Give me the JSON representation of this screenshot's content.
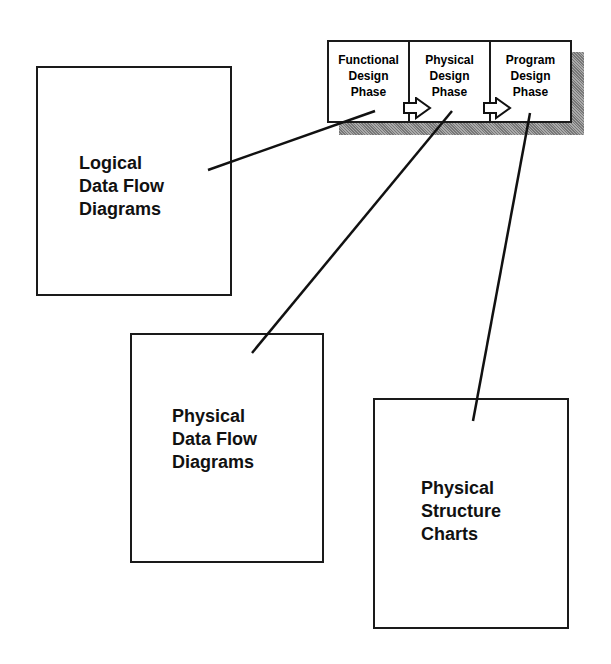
{
  "phases": [
    {
      "line1": "Functional",
      "line2": "Design",
      "line3": "Phase"
    },
    {
      "line1": "Physical",
      "line2": "Design",
      "line3": "Phase"
    },
    {
      "line1": "Program",
      "line2": "Design",
      "line3": "Phase"
    }
  ],
  "boxes": {
    "logical": {
      "line1": "Logical",
      "line2": "Data Flow",
      "line3": "Diagrams"
    },
    "physical_dfd": {
      "line1": "Physical",
      "line2": "Data Flow",
      "line3": "Diagrams"
    },
    "structure": {
      "line1": "Physical",
      "line2": "Structure",
      "line3": "Charts"
    }
  },
  "arrows": [
    "right-arrow-icon",
    "right-arrow-icon"
  ]
}
